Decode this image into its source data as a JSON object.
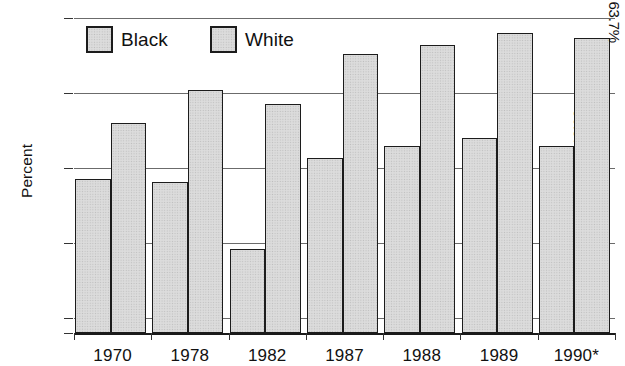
{
  "chart_data": {
    "type": "bar",
    "title": "",
    "xlabel": "",
    "ylabel": "Percent",
    "categories": [
      "1970",
      "1978",
      "1982",
      "1987",
      "1988",
      "1989",
      "1990*"
    ],
    "series": [
      {
        "name": "Black",
        "values": [
          54.3,
          54.1,
          49.6,
          55.7,
          56.5,
          57.0,
          56.5
        ]
      },
      {
        "name": "White",
        "values": [
          58.0,
          60.2,
          59.3,
          62.6,
          63.2,
          64.0,
          63.7
        ]
      }
    ],
    "ylim": [
      44.0,
      65.0
    ],
    "yticks": [
      "0",
      "45",
      "50",
      "55",
      "60",
      "65"
    ],
    "ytick_values": [
      44.0,
      45,
      50,
      55,
      60,
      65
    ],
    "axis_break": true,
    "grid": true,
    "legend_position": "top-left-inside",
    "data_labels": {
      "1990*": {
        "Black": "56.5%",
        "White": "63.7%"
      }
    }
  },
  "axis": {
    "y_title": "Percent",
    "y_ticks": [
      {
        "label": "65",
        "value": 65
      },
      {
        "label": "60",
        "value": 60
      },
      {
        "label": "55",
        "value": 55
      },
      {
        "label": "50",
        "value": 50
      },
      {
        "label": "45",
        "value": 45
      },
      {
        "label": "0",
        "value": 44.0
      }
    ],
    "x_ticks": [
      "1970",
      "1978",
      "1982",
      "1987",
      "1988",
      "1989",
      "1990*"
    ]
  },
  "legend": {
    "items": [
      {
        "label": "Black",
        "color": "#dcdcdc"
      },
      {
        "label": "White",
        "color": "#dcdcdc"
      }
    ]
  },
  "labels": {
    "black_1990": "56.5%",
    "white_1990": "63.7%"
  },
  "colors": {
    "bar_fill": "#dcdcdc",
    "bar_border": "#1c1c1c",
    "gridline": "#6b6b6b",
    "axis": "#1a1a1a",
    "text": "#111111",
    "background": "#ffffff"
  }
}
